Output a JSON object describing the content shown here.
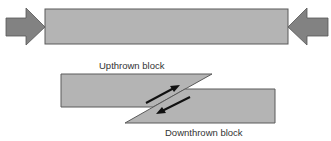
{
  "diagram": {
    "labels": {
      "upthrown": "Upthrown block",
      "downthrown": "Downthrown block"
    },
    "colors": {
      "block_fill": "#b4b4b4",
      "block_stroke": "#5a5a5a",
      "arrow_fill": "#828282",
      "arrow_stroke": "#555555",
      "motion_arrow": "#111111",
      "text": "#333333"
    },
    "elements": [
      {
        "id": "compression-bar",
        "type": "rectangle"
      },
      {
        "id": "compression-arrow-left",
        "direction": "right"
      },
      {
        "id": "compression-arrow-right",
        "direction": "left"
      },
      {
        "id": "upthrown-block",
        "motion": "up-right"
      },
      {
        "id": "downthrown-block",
        "motion": "down-left"
      }
    ]
  }
}
